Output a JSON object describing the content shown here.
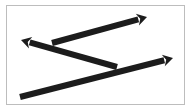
{
  "canvas": {
    "width": 193,
    "height": 112,
    "background": "#ffffff"
  },
  "frame": {
    "border_color": "#bdbdbd"
  },
  "arrow_color": "#1c1c1c",
  "arrows": [
    {
      "id": "upper-right-arrow",
      "from": [
        52,
        43
      ],
      "to": [
        147,
        17
      ],
      "direction": "right"
    },
    {
      "id": "left-pointing-arrow",
      "from": [
        117,
        67
      ],
      "to": [
        21,
        40
      ],
      "direction": "left"
    },
    {
      "id": "bottom-long-arrow",
      "from": [
        20,
        97
      ],
      "to": [
        173,
        58
      ],
      "direction": "right"
    }
  ]
}
